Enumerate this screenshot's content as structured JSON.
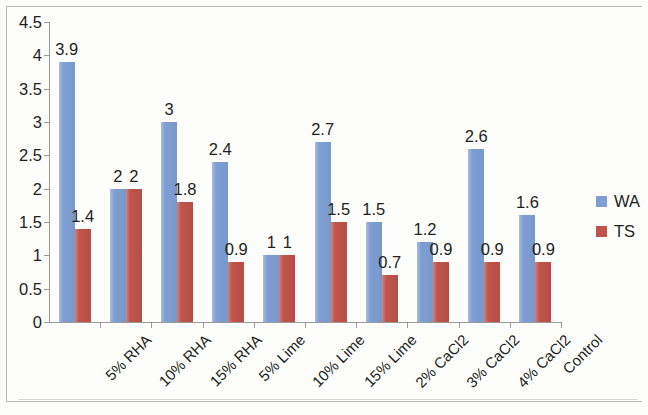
{
  "chart_data": {
    "type": "bar",
    "title": "",
    "xlabel": "",
    "ylabel": "",
    "ylim": [
      0,
      4.5
    ],
    "ytick_labels": [
      "4.5",
      "4",
      "3.5",
      "3",
      "2.5",
      "2",
      "1.5",
      "1",
      "0.5",
      "0"
    ],
    "ytick_values": [
      4.5,
      4,
      3.5,
      3,
      2.5,
      2,
      1.5,
      1,
      0.5,
      0
    ],
    "grid": false,
    "legend_position": "right",
    "categories": [
      "5% RHA",
      "10% RHA",
      "15% RHA",
      "5% Lime",
      "10% Lime",
      "15% Lime",
      "2% CaCl2",
      "3% CaCl2",
      "4% CaCl2",
      "Control"
    ],
    "series": [
      {
        "name": "WA",
        "color": "#7f9fd4",
        "values": [
          3.9,
          2,
          3,
          2.4,
          1,
          2.7,
          1.5,
          1.2,
          2.6,
          1.6
        ],
        "labels": [
          "3.9",
          "2",
          "3",
          "2.4",
          "1",
          "2.7",
          "1.5",
          "1.2",
          "2.6",
          "1.6"
        ]
      },
      {
        "name": "TS",
        "color": "#c0544a",
        "values": [
          1.4,
          2,
          1.8,
          0.9,
          1,
          1.5,
          0.7,
          0.9,
          0.9,
          0.9
        ],
        "labels": [
          "1.4",
          "2",
          "1.8",
          "0.9",
          "1",
          "1.5",
          "0.7",
          "0.9",
          "0.9",
          "0.9"
        ]
      }
    ]
  }
}
